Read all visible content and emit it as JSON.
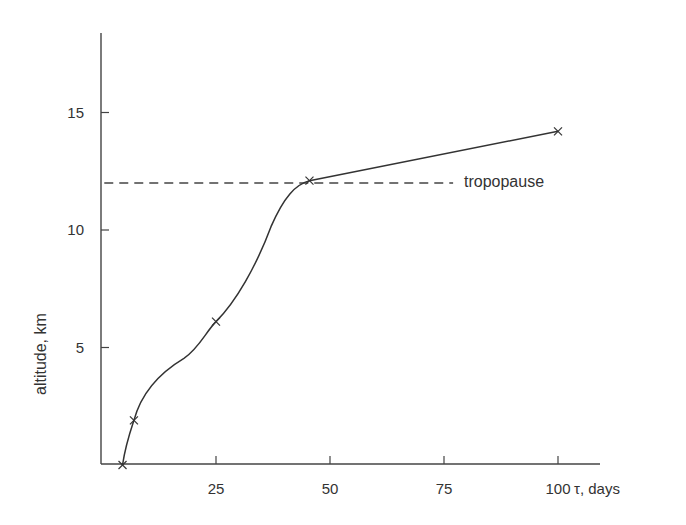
{
  "chart_data": {
    "type": "line",
    "title": "",
    "xlabel": "τ, days",
    "ylabel": "altitude, km",
    "xlim": [
      0,
      108
    ],
    "ylim": [
      0,
      18.5
    ],
    "grid": false,
    "legend": null,
    "x_ticks": [
      25,
      50,
      75,
      100
    ],
    "x_tick_labels": [
      "25",
      "50",
      "75",
      "100"
    ],
    "y_ticks": [
      5,
      10,
      15
    ],
    "y_tick_labels": [
      "5",
      "10",
      "15"
    ],
    "series": [
      {
        "name": "residence time vs altitude",
        "marker": "x",
        "style": "solid smooth curve",
        "points": [
          {
            "x": 4.5,
            "y": 0.0
          },
          {
            "x": 7.0,
            "y": 1.9
          },
          {
            "x": 25.0,
            "y": 6.1
          },
          {
            "x": 45.5,
            "y": 12.1
          },
          {
            "x": 100.0,
            "y": 14.2
          }
        ]
      }
    ],
    "reference_lines": [
      {
        "type": "horizontal",
        "y": 12.0,
        "style": "dashed",
        "label": "tropopause",
        "x_start": 0.5,
        "x_end": 77
      }
    ],
    "annotations": [
      {
        "text": "tropopause",
        "x": 80,
        "y": 12.0
      }
    ]
  },
  "labels": {
    "y_axis": "altitude, km",
    "x_axis": "τ, days",
    "tropopause": "tropopause",
    "yticks": [
      "5",
      "10",
      "15"
    ],
    "xticks": [
      "25",
      "50",
      "75",
      "100"
    ]
  }
}
